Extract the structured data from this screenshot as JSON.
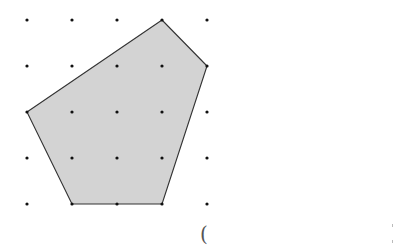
{
  "figure": {
    "type": "dot-grid-polygon",
    "grid": {
      "rows": 5,
      "cols": 5,
      "x_positions": [
        27,
        72,
        117,
        162,
        207
      ],
      "y_positions": [
        20,
        66,
        112,
        158,
        204
      ],
      "dot_color": "#111111",
      "dot_radius": 1.6
    },
    "polygon": {
      "vertices_grid": [
        [
          3,
          0
        ],
        [
          4,
          1
        ],
        [
          3,
          4
        ],
        [
          1,
          4
        ],
        [
          0,
          2
        ]
      ],
      "fill": "#d3d3d3",
      "stroke": "#333333",
      "stroke_width": 1.1
    }
  },
  "annotation": {
    "paren_text": "("
  }
}
